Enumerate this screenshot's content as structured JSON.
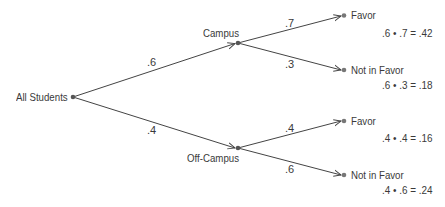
{
  "diagram": {
    "type": "probability-tree",
    "root": {
      "label": "All Students"
    },
    "level1": [
      {
        "label": "Campus",
        "prob": ".6"
      },
      {
        "label": "Off-Campus",
        "prob": ".4"
      }
    ],
    "level2": [
      {
        "parent": "Campus",
        "label": "Favor",
        "prob": ".7",
        "calc": ".6 • .7 = .42"
      },
      {
        "parent": "Campus",
        "label": "Not in Favor",
        "prob": ".3",
        "calc": ".6 • .3 = .18"
      },
      {
        "parent": "Off-Campus",
        "label": "Favor",
        "prob": ".4",
        "calc": ".4 • .4 = .16"
      },
      {
        "parent": "Off-Campus",
        "label": "Not in Favor",
        "prob": ".6",
        "calc": ".4 • .6 = .24"
      }
    ],
    "colors": {
      "line": "#444444",
      "node": "#555555",
      "text": "#3a3a3a"
    }
  }
}
